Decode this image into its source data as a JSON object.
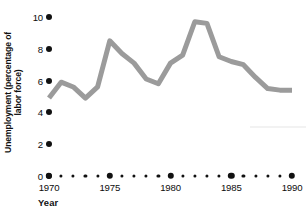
{
  "chart_data": {
    "type": "line",
    "title": "",
    "subtitle": "",
    "xlabel": "Year",
    "ylabel": "Unemployment (percentage of labor force)",
    "xlim": [
      1970,
      1990
    ],
    "ylim": [
      0,
      10
    ],
    "grid": false,
    "legend": null,
    "legend_position": "none",
    "line_color": "#9b9b9b",
    "line_width": 5,
    "axis_dot_color": "#111111",
    "x_ticks_major": [
      1970,
      1975,
      1980,
      1985,
      1990
    ],
    "x_ticks_minor": [
      1971,
      1972,
      1973,
      1974,
      1976,
      1977,
      1978,
      1979,
      1981,
      1982,
      1983,
      1984,
      1986,
      1987,
      1988,
      1989
    ],
    "x_tick_labels": [
      "1970",
      "1975",
      "1980",
      "1985",
      "1990"
    ],
    "y_ticks": [
      0,
      2,
      4,
      6,
      8,
      10
    ],
    "y_tick_labels": [
      "0",
      "2",
      "4",
      "6",
      "8",
      "10"
    ],
    "x": [
      1970,
      1971,
      1972,
      1973,
      1974,
      1975,
      1976,
      1977,
      1978,
      1979,
      1980,
      1981,
      1982,
      1983,
      1984,
      1985,
      1986,
      1987,
      1988,
      1989,
      1990
    ],
    "values": [
      4.9,
      5.9,
      5.6,
      4.9,
      5.6,
      8.5,
      7.7,
      7.1,
      6.1,
      5.8,
      7.1,
      7.6,
      9.7,
      9.6,
      7.5,
      7.2,
      7.0,
      6.2,
      5.5,
      5.4,
      5.4
    ],
    "series": [
      {
        "name": "Unemployment rate",
        "values": [
          4.9,
          5.9,
          5.6,
          4.9,
          5.6,
          8.5,
          7.7,
          7.1,
          6.1,
          5.8,
          7.1,
          7.6,
          9.7,
          9.6,
          7.5,
          7.2,
          7.0,
          6.2,
          5.5,
          5.4,
          5.4
        ]
      }
    ],
    "annotations": []
  },
  "axes": {
    "y_title": "Unemployment (percentage of",
    "y_title_line2": "labor force)",
    "x_title": "Year"
  }
}
